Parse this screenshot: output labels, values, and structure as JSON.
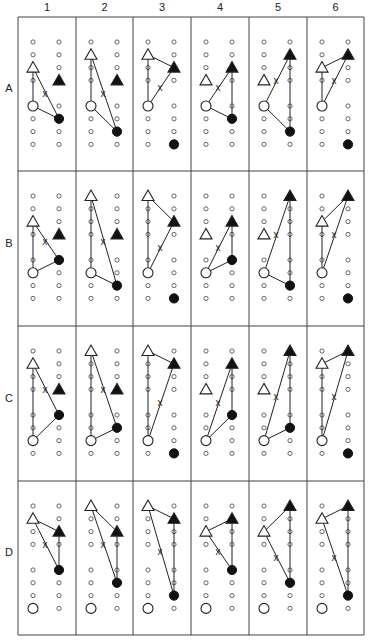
{
  "figure": {
    "column_headers": [
      "1",
      "2",
      "3",
      "4",
      "5",
      "6"
    ],
    "row_labels": [
      "A",
      "B",
      "C",
      "D"
    ],
    "gap_slot": 4,
    "slots_per_column": 9,
    "cross_mark": "x",
    "legend_of_markers": {
      "open_triangle": "left column, hollow triangle",
      "open_circle": "left column, hollow circle",
      "filled_triangle": "right column, solid triangle",
      "filled_circle": "right column, solid circle"
    }
  },
  "cells": {
    "A": [
      {
        "col": "1",
        "open_tri": 2,
        "open_circ": 5,
        "filled_tri": 3,
        "filled_circ": 6,
        "edges": [
          [
            "open_tri",
            "open_circ"
          ],
          [
            "open_circ",
            "filled_circ"
          ],
          [
            "open_tri",
            "filled_circ"
          ]
        ],
        "x_on": [
          "open_tri",
          "filled_circ"
        ]
      },
      {
        "col": "2",
        "open_tri": 1,
        "open_circ": 5,
        "filled_tri": 3,
        "filled_circ": 7,
        "edges": [
          [
            "open_tri",
            "open_circ"
          ],
          [
            "open_circ",
            "filled_circ"
          ],
          [
            "open_tri",
            "filled_circ"
          ]
        ],
        "x_on": [
          "open_tri",
          "filled_circ"
        ]
      },
      {
        "col": "3",
        "open_tri": 1,
        "open_circ": 5,
        "filled_tri": 2,
        "filled_circ": 8,
        "edges": [
          [
            "open_tri",
            "open_circ"
          ],
          [
            "open_tri",
            "filled_tri"
          ],
          [
            "open_circ",
            "filled_tri"
          ]
        ],
        "x_on": [
          "open_circ",
          "filled_tri"
        ]
      },
      {
        "col": "4",
        "open_tri": 3,
        "open_circ": 5,
        "filled_tri": 2,
        "filled_circ": 6,
        "edges": [
          [
            "open_circ",
            "filled_tri"
          ],
          [
            "open_circ",
            "filled_circ"
          ],
          [
            "filled_tri",
            "filled_circ"
          ]
        ],
        "x_on": [
          "open_circ",
          "filled_tri"
        ]
      },
      {
        "col": "5",
        "open_tri": 3,
        "open_circ": 5,
        "filled_tri": 1,
        "filled_circ": 7,
        "edges": [
          [
            "open_circ",
            "filled_tri"
          ],
          [
            "open_circ",
            "filled_circ"
          ],
          [
            "filled_tri",
            "filled_circ"
          ]
        ],
        "x_on": [
          "open_circ",
          "filled_tri"
        ]
      },
      {
        "col": "6",
        "open_tri": 2,
        "open_circ": 5,
        "filled_tri": 1,
        "filled_circ": 8,
        "edges": [
          [
            "open_tri",
            "filled_tri"
          ],
          [
            "open_tri",
            "open_circ"
          ],
          [
            "open_circ",
            "filled_tri"
          ]
        ],
        "x_on": [
          "open_circ",
          "filled_tri"
        ]
      }
    ],
    "B": [
      {
        "col": "1",
        "open_tri": 2,
        "open_circ": 6,
        "filled_tri": 3,
        "filled_circ": 5,
        "edges": [
          [
            "open_tri",
            "open_circ"
          ],
          [
            "open_tri",
            "filled_circ"
          ],
          [
            "open_circ",
            "filled_circ"
          ]
        ],
        "x_on": [
          "open_tri",
          "filled_circ"
        ]
      },
      {
        "col": "2",
        "open_tri": 0,
        "open_circ": 6,
        "filled_tri": 3,
        "filled_circ": 7,
        "edges": [
          [
            "open_tri",
            "open_circ"
          ],
          [
            "open_tri",
            "filled_circ"
          ],
          [
            "open_circ",
            "filled_circ"
          ]
        ],
        "x_on": [
          "open_tri",
          "filled_circ"
        ]
      },
      {
        "col": "3",
        "open_tri": 0,
        "open_circ": 6,
        "filled_tri": 2,
        "filled_circ": 8,
        "edges": [
          [
            "open_tri",
            "open_circ"
          ],
          [
            "open_tri",
            "filled_tri"
          ],
          [
            "open_circ",
            "filled_tri"
          ]
        ],
        "x_on": [
          "open_circ",
          "filled_tri"
        ]
      },
      {
        "col": "4",
        "open_tri": 3,
        "open_circ": 6,
        "filled_tri": 2,
        "filled_circ": 5,
        "edges": [
          [
            "open_circ",
            "filled_tri"
          ],
          [
            "open_circ",
            "filled_circ"
          ],
          [
            "filled_tri",
            "filled_circ"
          ]
        ],
        "x_on": [
          "open_circ",
          "filled_tri"
        ]
      },
      {
        "col": "5",
        "open_tri": 3,
        "open_circ": 6,
        "filled_tri": 0,
        "filled_circ": 7,
        "edges": [
          [
            "open_circ",
            "filled_tri"
          ],
          [
            "open_circ",
            "filled_circ"
          ],
          [
            "filled_tri",
            "filled_circ"
          ]
        ],
        "x_on": [
          "open_circ",
          "filled_tri"
        ]
      },
      {
        "col": "6",
        "open_tri": 2,
        "open_circ": 6,
        "filled_tri": 0,
        "filled_circ": 8,
        "edges": [
          [
            "open_tri",
            "filled_tri"
          ],
          [
            "open_tri",
            "open_circ"
          ],
          [
            "open_circ",
            "filled_tri"
          ]
        ],
        "x_on": [
          "open_circ",
          "filled_tri"
        ]
      }
    ],
    "C": [
      {
        "col": "1",
        "open_tri": 1,
        "open_circ": 7,
        "filled_tri": 3,
        "filled_circ": 5,
        "edges": [
          [
            "open_tri",
            "open_circ"
          ],
          [
            "open_tri",
            "filled_circ"
          ],
          [
            "open_circ",
            "filled_circ"
          ]
        ],
        "x_on": [
          "open_tri",
          "filled_circ"
        ]
      },
      {
        "col": "2",
        "open_tri": 0,
        "open_circ": 7,
        "filled_tri": 3,
        "filled_circ": 6,
        "edges": [
          [
            "open_tri",
            "open_circ"
          ],
          [
            "open_tri",
            "filled_circ"
          ],
          [
            "open_circ",
            "filled_circ"
          ]
        ],
        "x_on": [
          "open_tri",
          "filled_circ"
        ]
      },
      {
        "col": "3",
        "open_tri": 0,
        "open_circ": 7,
        "filled_tri": 1,
        "filled_circ": 8,
        "edges": [
          [
            "open_tri",
            "open_circ"
          ],
          [
            "open_tri",
            "filled_tri"
          ],
          [
            "open_circ",
            "filled_tri"
          ]
        ],
        "x_on": [
          "open_circ",
          "filled_tri"
        ]
      },
      {
        "col": "4",
        "open_tri": 3,
        "open_circ": 7,
        "filled_tri": 1,
        "filled_circ": 5,
        "edges": [
          [
            "open_circ",
            "filled_tri"
          ],
          [
            "open_circ",
            "filled_circ"
          ],
          [
            "filled_tri",
            "filled_circ"
          ]
        ],
        "x_on": [
          "open_circ",
          "filled_tri"
        ]
      },
      {
        "col": "5",
        "open_tri": 3,
        "open_circ": 7,
        "filled_tri": 0,
        "filled_circ": 6,
        "edges": [
          [
            "open_circ",
            "filled_tri"
          ],
          [
            "open_circ",
            "filled_circ"
          ],
          [
            "filled_tri",
            "filled_circ"
          ]
        ],
        "x_on": [
          "open_circ",
          "filled_tri"
        ]
      },
      {
        "col": "6",
        "open_tri": 1,
        "open_circ": 7,
        "filled_tri": 0,
        "filled_circ": 8,
        "edges": [
          [
            "open_tri",
            "filled_tri"
          ],
          [
            "open_tri",
            "open_circ"
          ],
          [
            "open_circ",
            "filled_tri"
          ]
        ],
        "x_on": [
          "open_circ",
          "filled_tri"
        ]
      }
    ],
    "D": [
      {
        "col": "1",
        "open_tri": 1,
        "open_circ": 8,
        "filled_tri": 2,
        "filled_circ": 5,
        "edges": [
          [
            "open_tri",
            "filled_tri"
          ],
          [
            "open_tri",
            "filled_circ"
          ],
          [
            "filled_tri",
            "filled_circ"
          ]
        ],
        "x_on": [
          "open_tri",
          "filled_circ"
        ]
      },
      {
        "col": "2",
        "open_tri": 0,
        "open_circ": 8,
        "filled_tri": 2,
        "filled_circ": 6,
        "edges": [
          [
            "open_tri",
            "filled_tri"
          ],
          [
            "open_tri",
            "filled_circ"
          ],
          [
            "filled_tri",
            "filled_circ"
          ]
        ],
        "x_on": [
          "open_tri",
          "filled_circ"
        ]
      },
      {
        "col": "3",
        "open_tri": 0,
        "open_circ": 8,
        "filled_tri": 1,
        "filled_circ": 7,
        "edges": [
          [
            "open_tri",
            "filled_tri"
          ],
          [
            "open_tri",
            "filled_circ"
          ],
          [
            "filled_tri",
            "filled_circ"
          ]
        ],
        "x_on": [
          "open_tri",
          "filled_circ"
        ]
      },
      {
        "col": "4",
        "open_tri": 2,
        "open_circ": 8,
        "filled_tri": 1,
        "filled_circ": 5,
        "edges": [
          [
            "open_tri",
            "filled_tri"
          ],
          [
            "open_tri",
            "filled_circ"
          ],
          [
            "filled_tri",
            "filled_circ"
          ]
        ],
        "x_on": [
          "open_tri",
          "filled_circ"
        ]
      },
      {
        "col": "5",
        "open_tri": 2,
        "open_circ": 8,
        "filled_tri": 0,
        "filled_circ": 6,
        "edges": [
          [
            "open_tri",
            "filled_tri"
          ],
          [
            "open_tri",
            "filled_circ"
          ],
          [
            "filled_tri",
            "filled_circ"
          ]
        ],
        "x_on": [
          "open_tri",
          "filled_circ"
        ]
      },
      {
        "col": "6",
        "open_tri": 1,
        "open_circ": 8,
        "filled_tri": 0,
        "filled_circ": 7,
        "edges": [
          [
            "open_tri",
            "filled_tri"
          ],
          [
            "open_tri",
            "filled_circ"
          ],
          [
            "filled_tri",
            "filled_circ"
          ]
        ],
        "x_on": [
          "open_tri",
          "filled_circ"
        ]
      }
    ]
  }
}
